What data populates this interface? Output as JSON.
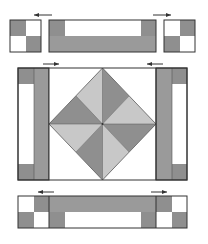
{
  "diagram": {
    "colors": {
      "dark": "#8f8f8f",
      "medium": "#a0a0a0",
      "light": "#c8c8c8",
      "white": "#ffffff",
      "outline": "#333333"
    },
    "rows": [
      {
        "name": "top-row",
        "pieces": [
          "four-patch",
          "strip-unit",
          "four-patch"
        ],
        "arrows": [
          "left",
          "right"
        ]
      },
      {
        "name": "middle-row",
        "pieces": [
          "side-unit",
          "square-in-square-center",
          "side-unit"
        ],
        "arrows": [
          "right",
          "left"
        ]
      },
      {
        "name": "bottom-row",
        "pieces": [
          "four-patch",
          "strip-unit",
          "four-patch"
        ],
        "arrows": [
          "left",
          "right"
        ]
      }
    ],
    "pressing_arrows": 6
  }
}
